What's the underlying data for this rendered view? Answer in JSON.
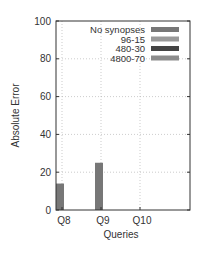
{
  "chart_data": {
    "type": "bar",
    "title": "",
    "xlabel": "Queries",
    "ylabel": "Absolute Error",
    "categories": [
      "Q8",
      "Q9",
      "Q10"
    ],
    "ylim": [
      0,
      100
    ],
    "yticks": [
      0,
      20,
      40,
      60,
      80,
      100
    ],
    "grid": true,
    "legend_position": "top-right inside",
    "series": [
      {
        "name": "No synopses",
        "color": "#777777",
        "values": [
          14,
          25,
          0
        ]
      },
      {
        "name": "96-15",
        "color": "#999999",
        "values": [
          0,
          0,
          0
        ]
      },
      {
        "name": "480-30",
        "color": "#444444",
        "values": [
          0,
          0,
          0
        ]
      },
      {
        "name": "4800-70",
        "color": "#8c8c8c",
        "values": [
          0,
          0,
          0
        ]
      }
    ]
  }
}
